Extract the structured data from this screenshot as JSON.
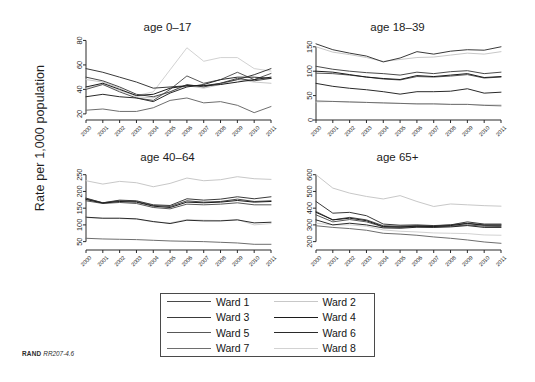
{
  "figure": {
    "ylabel": "Rate per 1,000 population",
    "footer_brand": "RAND",
    "footer_number": "RR207-4.6"
  },
  "legend": {
    "position": "bottom-center",
    "entries": [
      {
        "label": "Ward 1",
        "color": "#4a4a4a"
      },
      {
        "label": "Ward 2",
        "color": "#c8c8c8"
      },
      {
        "label": "Ward 3",
        "color": "#3a3a3a"
      },
      {
        "label": "Ward 4",
        "color": "#1c1c1c"
      },
      {
        "label": "Ward 5",
        "color": "#585858"
      },
      {
        "label": "Ward 6",
        "color": "#2a2a2a"
      },
      {
        "label": "Ward 7",
        "color": "#6e6e6e"
      },
      {
        "label": "Ward 8",
        "color": "#d2d2d2"
      }
    ]
  },
  "chart_data": [
    {
      "type": "line",
      "title": "age 0–17",
      "xlabel": "",
      "ylabel": "Rate per 1,000 population",
      "x": [
        2000,
        2001,
        2002,
        2003,
        2004,
        2005,
        2006,
        2007,
        2008,
        2009,
        2010,
        2011
      ],
      "xticklabels": [
        "2000",
        "2001",
        "2002",
        "2003",
        "2004",
        "2005",
        "2006",
        "2007",
        "2008",
        "2009",
        "2010",
        "2011"
      ],
      "yticks": [
        20,
        40,
        60,
        80
      ],
      "ylim": [
        15,
        82
      ],
      "grid": false,
      "series": [
        {
          "name": "Ward 1",
          "color": "#4a4a4a",
          "values": [
            50,
            47,
            42,
            36,
            34,
            38,
            44,
            42,
            45,
            49,
            47,
            49
          ]
        },
        {
          "name": "Ward 2",
          "color": "#c8c8c8",
          "values": [
            48,
            46,
            41,
            34,
            33,
            38,
            43,
            41,
            44,
            48,
            46,
            45
          ]
        },
        {
          "name": "Ward 3",
          "color": "#3a3a3a",
          "values": [
            57,
            54,
            50,
            46,
            41,
            42,
            43,
            43,
            45,
            48,
            52,
            57
          ]
        },
        {
          "name": "Ward 4",
          "color": "#1c1c1c",
          "values": [
            42,
            45,
            40,
            35,
            36,
            41,
            43,
            43,
            44,
            46,
            48,
            50
          ]
        },
        {
          "name": "Ward 5",
          "color": "#585858",
          "values": [
            40,
            44,
            38,
            33,
            31,
            40,
            51,
            45,
            48,
            54,
            48,
            53
          ]
        },
        {
          "name": "Ward 6",
          "color": "#2a2a2a",
          "values": [
            34,
            36,
            34,
            33,
            30,
            37,
            42,
            44,
            48,
            50,
            50,
            49
          ]
        },
        {
          "name": "Ward 7",
          "color": "#6e6e6e",
          "values": [
            23,
            24,
            22,
            22,
            25,
            31,
            33,
            29,
            30,
            27,
            21,
            26
          ]
        },
        {
          "name": "Ward 8",
          "color": "#d2d2d2",
          "values": [
            41,
            44,
            39,
            35,
            38,
            56,
            74,
            63,
            66,
            66,
            57,
            55
          ]
        }
      ]
    },
    {
      "type": "line",
      "title": "age 18–39",
      "xlabel": "",
      "ylabel": "Rate per 1,000 population",
      "x": [
        2000,
        2001,
        2002,
        2003,
        2004,
        2005,
        2006,
        2007,
        2008,
        2009,
        2010,
        2011
      ],
      "xticklabels": [
        "2000",
        "2001",
        "2002",
        "2003",
        "2004",
        "2005",
        "2006",
        "2007",
        "2008",
        "2009",
        "2010",
        "2011"
      ],
      "yticks": [
        0,
        50,
        100,
        150
      ],
      "ylim": [
        0,
        168
      ],
      "grid": false,
      "series": [
        {
          "name": "Ward 1",
          "color": "#4a4a4a",
          "values": [
            110,
            104,
            100,
            97,
            95,
            92,
            98,
            95,
            99,
            101,
            95,
            98
          ]
        },
        {
          "name": "Ward 2",
          "color": "#c8c8c8",
          "values": [
            150,
            139,
            134,
            128,
            120,
            124,
            128,
            129,
            133,
            137,
            135,
            140
          ]
        },
        {
          "name": "Ward 3",
          "color": "#3a3a3a",
          "values": [
            156,
            144,
            137,
            131,
            119,
            127,
            140,
            135,
            141,
            144,
            143,
            150
          ]
        },
        {
          "name": "Ward 4",
          "color": "#1c1c1c",
          "values": [
            100,
            98,
            93,
            88,
            85,
            83,
            91,
            89,
            92,
            95,
            87,
            89
          ]
        },
        {
          "name": "Ward 5",
          "color": "#585858",
          "values": [
            96,
            95,
            92,
            88,
            84,
            82,
            89,
            88,
            90,
            93,
            86,
            88
          ]
        },
        {
          "name": "Ward 6",
          "color": "#2a2a2a",
          "values": [
            75,
            69,
            65,
            62,
            58,
            53,
            58,
            58,
            59,
            64,
            55,
            57
          ]
        },
        {
          "name": "Ward 7",
          "color": "#6e6e6e",
          "values": [
            39,
            38,
            37,
            36,
            35,
            34,
            33,
            33,
            32,
            32,
            30,
            29
          ]
        },
        {
          "name": "Ward 8",
          "color": "#d2d2d2",
          "values": [
            37,
            38,
            37,
            36,
            35,
            34,
            33,
            33,
            32,
            32,
            31,
            31
          ]
        }
      ]
    },
    {
      "type": "line",
      "title": "age 40–64",
      "xlabel": "",
      "ylabel": "Rate per 1,000 population",
      "x": [
        2000,
        2001,
        2002,
        2003,
        2004,
        2005,
        2006,
        2007,
        2008,
        2009,
        2010,
        2011
      ],
      "xticklabels": [
        "2000",
        "2001",
        "2002",
        "2003",
        "2004",
        "2005",
        "2006",
        "2007",
        "2008",
        "2009",
        "2010",
        "2011"
      ],
      "yticks": [
        50,
        100,
        150,
        200,
        250
      ],
      "ylim": [
        25,
        270
      ],
      "grid": false,
      "series": [
        {
          "name": "Ward 1",
          "color": "#4a4a4a",
          "values": [
            178,
            166,
            172,
            170,
            158,
            155,
            172,
            168,
            170,
            177,
            170,
            172
          ]
        },
        {
          "name": "Ward 2",
          "color": "#c8c8c8",
          "values": [
            232,
            222,
            230,
            226,
            214,
            224,
            240,
            232,
            235,
            244,
            238,
            236
          ]
        },
        {
          "name": "Ward 3",
          "color": "#3a3a3a",
          "values": [
            180,
            166,
            174,
            172,
            160,
            158,
            178,
            174,
            177,
            184,
            178,
            184
          ]
        },
        {
          "name": "Ward 4",
          "color": "#1c1c1c",
          "values": [
            176,
            165,
            170,
            168,
            156,
            152,
            168,
            166,
            168,
            173,
            168,
            170
          ]
        },
        {
          "name": "Ward 5",
          "color": "#585858",
          "values": [
            172,
            164,
            167,
            164,
            152,
            148,
            162,
            160,
            162,
            166,
            160,
            160
          ]
        },
        {
          "name": "Ward 6",
          "color": "#2a2a2a",
          "values": [
            123,
            120,
            120,
            118,
            110,
            104,
            114,
            112,
            112,
            115,
            106,
            108
          ]
        },
        {
          "name": "Ward 7",
          "color": "#6e6e6e",
          "values": [
            60,
            58,
            57,
            56,
            54,
            52,
            51,
            50,
            48,
            46,
            42,
            42
          ]
        },
        {
          "name": "Ward 8",
          "color": "#d2d2d2",
          "values": [
            122,
            119,
            119,
            117,
            109,
            106,
            116,
            114,
            113,
            116,
            100,
            104
          ]
        }
      ]
    },
    {
      "type": "line",
      "title": "age 65+",
      "xlabel": "",
      "ylabel": "Rate per 1,000 population",
      "x": [
        2000,
        2001,
        2002,
        2003,
        2004,
        2005,
        2006,
        2007,
        2008,
        2009,
        2010,
        2011
      ],
      "xticklabels": [
        "2000",
        "2001",
        "2002",
        "2003",
        "2004",
        "2005",
        "2006",
        "2007",
        "2008",
        "2009",
        "2010",
        "2011"
      ],
      "yticks": [
        200,
        300,
        400,
        500,
        600
      ],
      "ylim": [
        150,
        640
      ],
      "grid": false,
      "series": [
        {
          "name": "Ward 1",
          "color": "#4a4a4a",
          "values": [
            380,
            330,
            345,
            330,
            295,
            292,
            296,
            294,
            300,
            310,
            300,
            300
          ]
        },
        {
          "name": "Ward 2",
          "color": "#c8c8c8",
          "values": [
            600,
            520,
            490,
            470,
            455,
            475,
            440,
            410,
            425,
            420,
            415,
            412
          ]
        },
        {
          "name": "Ward 3",
          "color": "#3a3a3a",
          "values": [
            440,
            370,
            375,
            355,
            305,
            298,
            300,
            296,
            300,
            318,
            305,
            305
          ]
        },
        {
          "name": "Ward 4",
          "color": "#1c1c1c",
          "values": [
            375,
            330,
            340,
            325,
            290,
            288,
            292,
            290,
            296,
            308,
            298,
            298
          ]
        },
        {
          "name": "Ward 5",
          "color": "#585858",
          "values": [
            360,
            318,
            332,
            318,
            288,
            285,
            290,
            288,
            292,
            300,
            292,
            290
          ]
        },
        {
          "name": "Ward 6",
          "color": "#2a2a2a",
          "values": [
            330,
            300,
            310,
            300,
            282,
            280,
            286,
            285,
            288,
            296,
            285,
            285
          ]
        },
        {
          "name": "Ward 7",
          "color": "#6e6e6e",
          "values": [
            295,
            285,
            278,
            268,
            250,
            245,
            238,
            228,
            220,
            210,
            198,
            190
          ]
        },
        {
          "name": "Ward 8",
          "color": "#d2d2d2",
          "values": [
            310,
            300,
            300,
            292,
            270,
            262,
            258,
            252,
            250,
            248,
            240,
            238
          ]
        }
      ]
    }
  ]
}
